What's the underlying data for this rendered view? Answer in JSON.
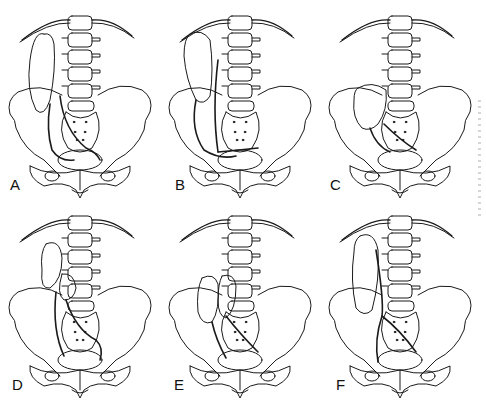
{
  "figure": {
    "panels": [
      {
        "label": "A",
        "x": 0,
        "y": 0,
        "label_x": 10,
        "label_y": 176,
        "variant": "ectopic-lumbar-elongated"
      },
      {
        "label": "B",
        "x": 160,
        "y": 0,
        "label_x": 175,
        "label_y": 176,
        "variant": "ectopic-lumbar-rotated"
      },
      {
        "label": "C",
        "x": 320,
        "y": 0,
        "label_x": 330,
        "label_y": 176,
        "variant": "pelvic-kidney"
      },
      {
        "label": "D",
        "x": 0,
        "y": 200,
        "label_x": 12,
        "label_y": 376,
        "variant": "crossed-fused-superior"
      },
      {
        "label": "E",
        "x": 160,
        "y": 200,
        "label_x": 174,
        "label_y": 376,
        "variant": "crossed-fused-side-by-side"
      },
      {
        "label": "F",
        "x": 320,
        "y": 200,
        "label_x": 336,
        "label_y": 376,
        "variant": "crossed-ectopia-unfused"
      }
    ],
    "line_color": "#1a1a1a",
    "background": "#ffffff"
  }
}
